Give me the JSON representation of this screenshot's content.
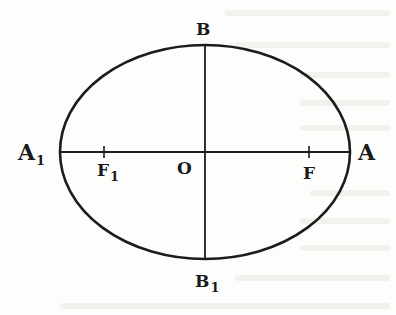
{
  "diagram": {
    "type": "ellipse",
    "colors": {
      "stroke": "#1c1c1c",
      "background": "#fdfdfb",
      "text": "#1a1a1a"
    },
    "ellipse": {
      "cx": 205,
      "cy": 152,
      "rx": 145,
      "ry": 107
    },
    "labels": {
      "top": "B",
      "bottom": "B",
      "bottom_sub": "1",
      "left": "A",
      "left_sub": "1",
      "right": "A",
      "center": "O",
      "focus_left": "F",
      "focus_left_sub": "1",
      "focus_right": "F"
    },
    "points": {
      "A1": [
        60,
        152
      ],
      "A": [
        350,
        152
      ],
      "B": [
        205,
        45
      ],
      "B1": [
        205,
        259
      ],
      "O": [
        205,
        152
      ],
      "F1": [
        104,
        152
      ],
      "F": [
        309,
        152
      ]
    }
  }
}
